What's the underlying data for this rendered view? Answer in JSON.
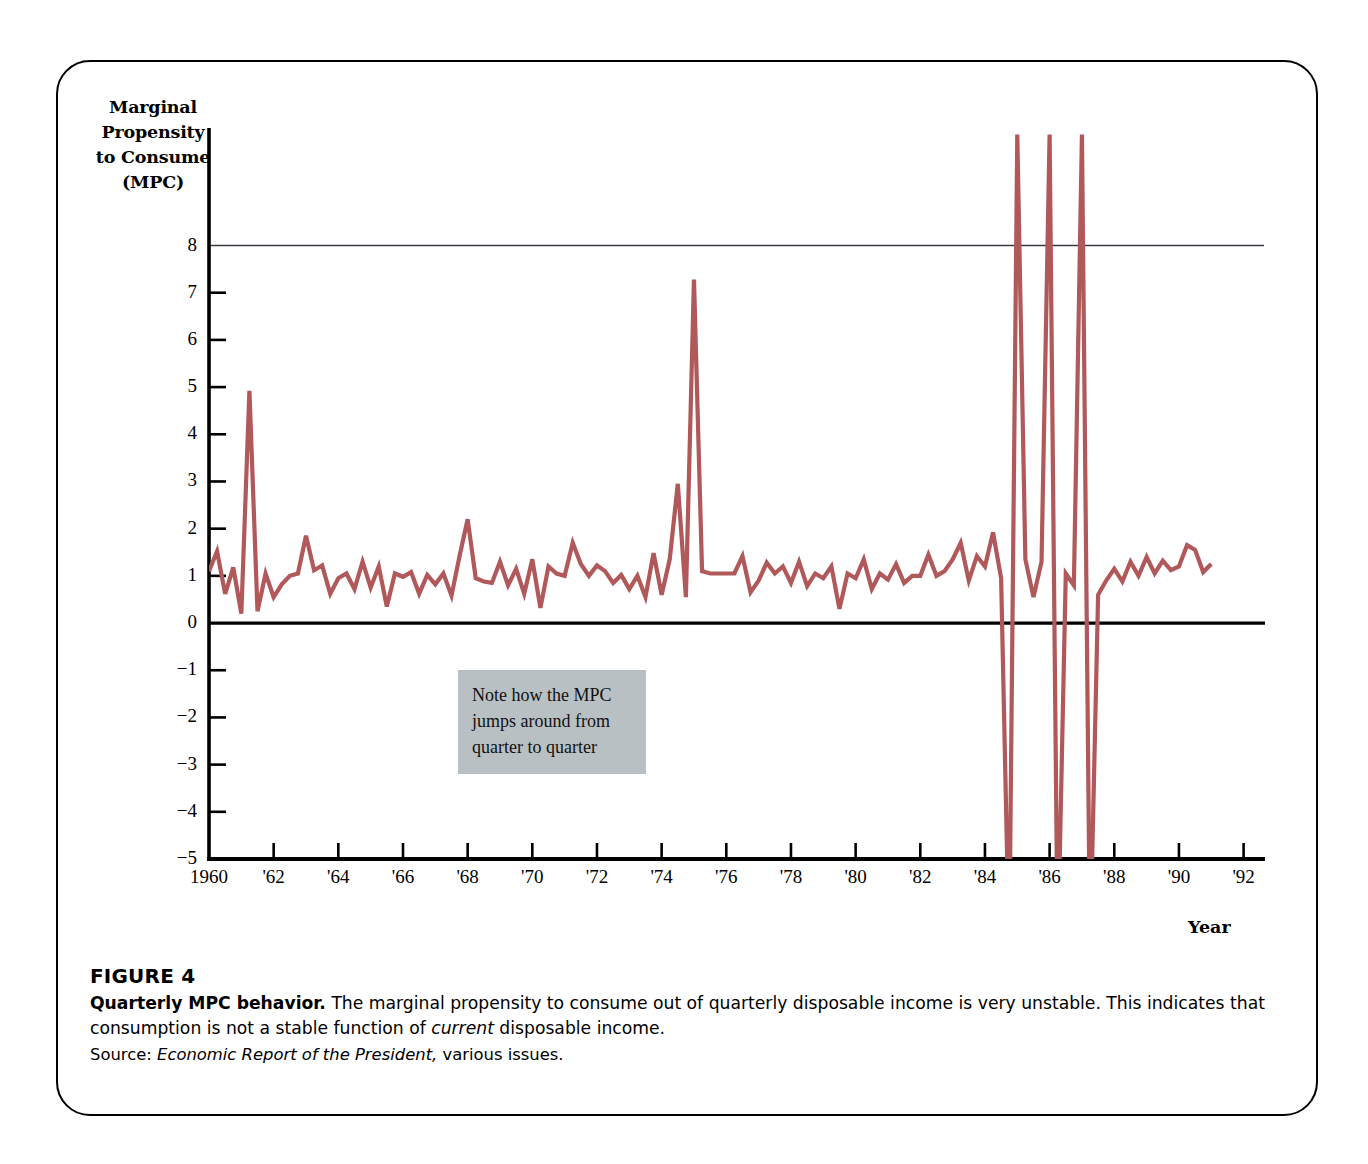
{
  "figure": {
    "number_label": "FIGURE 4",
    "title": "Quarterly MPC behavior.",
    "body_part1": "The marginal propensity to consume out of quarterly disposable income is very unstable. This indicates that consumption is not a stable function of ",
    "body_emphasis": "current",
    "body_part2": " disposable income.",
    "source_prefix": "Source: ",
    "source_title": "Economic Report of the President,",
    "source_suffix": " various issues."
  },
  "annotation": {
    "line1": "Note how the MPC",
    "line2": "jumps around from",
    "line3": "quarter to quarter",
    "background_color": "#b9c0c4"
  },
  "colors": {
    "series_line": "#b0585a",
    "axis": "#000000",
    "gridline_top": "#3a3a44",
    "card_border": "#000000",
    "page_background": "#ffffff"
  },
  "chart_data": {
    "type": "line",
    "title": "Quarterly MPC behavior",
    "xlabel": "Year",
    "ylabel": "Marginal Propensity to Consume (MPC)",
    "ylabel_lines": [
      "Marginal",
      "Propensity",
      "to Consume",
      "(MPC)"
    ],
    "xlim": [
      1960.0,
      1992.6
    ],
    "ylim": [
      -5,
      8.35
    ],
    "grid": false,
    "gridlines_drawn": [
      8
    ],
    "zero_line": 0,
    "legend": null,
    "ytick_values": [
      8,
      7,
      6,
      5,
      4,
      3,
      2,
      1,
      0,
      -1,
      -2,
      -3,
      -4,
      -5
    ],
    "ytick_labels": [
      "8",
      "7",
      "6",
      "5",
      "4",
      "3",
      "2",
      "1",
      "0",
      "−1",
      "−2",
      "−3",
      "−4",
      "−5"
    ],
    "xtick_values": [
      1960,
      1962,
      1964,
      1966,
      1968,
      1970,
      1972,
      1974,
      1976,
      1978,
      1980,
      1982,
      1984,
      1986,
      1988,
      1990,
      1992
    ],
    "xtick_labels": [
      "1960",
      "'62",
      "'64",
      "'66",
      "'68",
      "'70",
      "'72",
      "'74",
      "'76",
      "'78",
      "'80",
      "'82",
      "'84",
      "'86",
      "'88",
      "'90",
      "'92"
    ],
    "series": [
      {
        "name": "MPC (quarterly)",
        "color": "#b0585a",
        "x": [
          1960.0,
          1960.25,
          1960.5,
          1960.75,
          1961.0,
          1961.25,
          1961.5,
          1961.75,
          1962.0,
          1962.25,
          1962.5,
          1962.75,
          1963.0,
          1963.25,
          1963.5,
          1963.75,
          1964.0,
          1964.25,
          1964.5,
          1964.75,
          1965.0,
          1965.25,
          1965.5,
          1965.75,
          1966.0,
          1966.25,
          1966.5,
          1966.75,
          1967.0,
          1967.25,
          1967.5,
          1967.75,
          1968.0,
          1968.25,
          1968.5,
          1968.75,
          1969.0,
          1969.25,
          1969.5,
          1969.75,
          1970.0,
          1970.25,
          1970.5,
          1970.75,
          1971.0,
          1971.25,
          1971.5,
          1971.75,
          1972.0,
          1972.25,
          1972.5,
          1972.75,
          1973.0,
          1973.25,
          1973.5,
          1973.75,
          1974.0,
          1974.25,
          1974.5,
          1974.75,
          1975.0,
          1975.25,
          1975.5,
          1975.75,
          1976.0,
          1976.25,
          1976.5,
          1976.75,
          1977.0,
          1977.25,
          1977.5,
          1977.75,
          1978.0,
          1978.25,
          1978.5,
          1978.75,
          1979.0,
          1979.25,
          1979.5,
          1979.75,
          1980.0,
          1980.25,
          1980.5,
          1980.75,
          1981.0,
          1981.25,
          1981.5,
          1981.75,
          1982.0,
          1982.25,
          1982.5,
          1982.75,
          1983.0,
          1983.25,
          1983.5,
          1983.75,
          1984.0,
          1984.25,
          1984.5,
          1984.75,
          1985.0,
          1985.25,
          1985.5,
          1985.75,
          1986.0,
          1986.25,
          1986.5,
          1986.75,
          1987.0,
          1987.25,
          1987.5,
          1987.75,
          1988.0,
          1988.25,
          1988.5,
          1988.75,
          1989.0,
          1989.25,
          1989.5,
          1989.75,
          1990.0,
          1990.25,
          1990.5,
          1990.75,
          1991.0
        ],
        "y": [
          1.1,
          1.52,
          0.62,
          1.18,
          0.2,
          4.92,
          0.25,
          1.05,
          0.55,
          0.82,
          1.0,
          1.05,
          1.85,
          1.12,
          1.22,
          0.62,
          0.95,
          1.05,
          0.72,
          1.3,
          0.75,
          1.2,
          0.35,
          1.05,
          0.98,
          1.08,
          0.62,
          1.02,
          0.82,
          1.05,
          0.58,
          1.42,
          2.2,
          0.95,
          0.88,
          0.85,
          1.3,
          0.8,
          1.15,
          0.62,
          1.35,
          0.32,
          1.2,
          1.05,
          1.0,
          1.7,
          1.25,
          1.0,
          1.22,
          1.1,
          0.85,
          1.02,
          0.72,
          1.0,
          0.55,
          1.48,
          0.6,
          1.35,
          2.95,
          0.55,
          7.28,
          1.1,
          1.05,
          1.05,
          1.05,
          1.05,
          1.42,
          0.65,
          0.9,
          1.28,
          1.05,
          1.2,
          0.85,
          1.3,
          0.78,
          1.05,
          0.95,
          1.2,
          0.3,
          1.05,
          0.95,
          1.35,
          0.72,
          1.05,
          0.92,
          1.25,
          0.85,
          1.0,
          1.0,
          1.45,
          1.0,
          1.1,
          1.35,
          1.7,
          0.9,
          1.42,
          1.2,
          1.92,
          0.95,
          -12.0,
          14.0,
          1.35,
          0.55,
          1.3,
          20.0,
          -20.0,
          1.05,
          0.8,
          14.0,
          -18.0,
          0.6,
          0.9,
          1.15,
          0.88,
          1.3,
          1.0,
          1.4,
          1.05,
          1.32,
          1.12,
          1.2,
          1.65,
          1.55,
          1.08,
          1.25
        ]
      }
    ],
    "offscale_note": "Several 1985-1987 quarters exceed the plotted range and are clipped at the +8 / -5 edges."
  }
}
